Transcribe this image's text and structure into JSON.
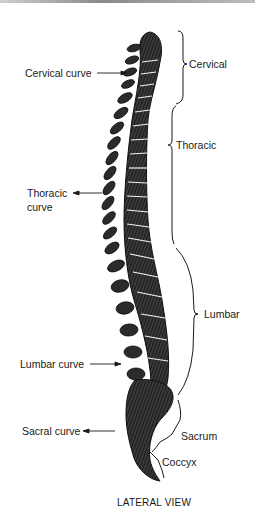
{
  "diagram": {
    "caption": "LATERAL VIEW",
    "left_labels": {
      "cervical_curve": "Cervical curve",
      "thoracic_curve_line1": "Thoracic",
      "thoracic_curve_line2": "curve",
      "lumbar_curve": "Lumbar curve",
      "sacral_curve": "Sacral curve"
    },
    "right_labels": {
      "cervical": "Cervical",
      "thoracic": "Thoracic",
      "lumbar": "Lumbar",
      "sacrum": "Sacrum",
      "coccyx": "Coccyx"
    },
    "colors": {
      "ink": "#1a1a1a",
      "background": "#ffffff"
    }
  }
}
